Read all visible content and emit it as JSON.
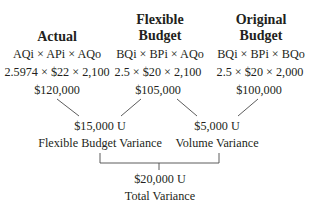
{
  "columns": [
    {
      "id": "actual",
      "heading_lines": [
        "",
        "Actual"
      ],
      "formula": "AQi × APi × AQo",
      "computation": "2.5974 × $22 × 2,100",
      "total": "$120,000"
    },
    {
      "id": "flexible-budget",
      "heading_lines": [
        "Flexible",
        "Budget"
      ],
      "formula": "BQi × BPi × AQo",
      "computation": "2.5 × $20 × 2,100",
      "total": "$105,000"
    },
    {
      "id": "original-budget",
      "heading_lines": [
        "Original",
        "Budget"
      ],
      "formula": "BQi × BPi × BQo",
      "computation": "2.5 × $20 × 2,000",
      "total": "$100,000"
    }
  ],
  "variances": [
    {
      "id": "flexible-budget-variance",
      "amount": "$15,000 U",
      "label": "Flexible Budget Variance",
      "between": [
        "actual",
        "flexible-budget"
      ]
    },
    {
      "id": "volume-variance",
      "amount": "$5,000 U",
      "label": "Volume Variance",
      "between": [
        "flexible-budget",
        "original-budget"
      ]
    }
  ],
  "total_variance": {
    "amount": "$20,000 U",
    "label": "Total Variance"
  },
  "colors": {
    "text": "#231f20",
    "lines": "#4a4a4a"
  }
}
